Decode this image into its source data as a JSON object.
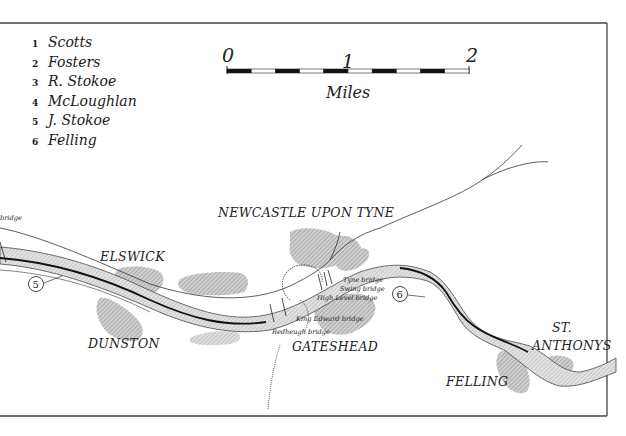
{
  "legend": {
    "items": [
      {
        "number": "1",
        "name": "Scotts"
      },
      {
        "number": "2",
        "name": "Fosters"
      },
      {
        "number": "3",
        "name": "R. Stokoe"
      },
      {
        "number": "4",
        "name": "McLoughlan"
      },
      {
        "number": "5",
        "name": "J. Stokoe"
      },
      {
        "number": "6",
        "name": "Felling"
      }
    ]
  },
  "scale_bar": {
    "ticks": [
      "0",
      "1",
      "2"
    ],
    "unit": "Miles",
    "segments_per_unit": 5
  },
  "places": {
    "newcastle": "NEWCASTLE UPON TYNE",
    "elswick": "ELSWICK",
    "dunston": "DUNSTON",
    "gateshead": "GATESHEAD",
    "st": "ST.",
    "anthonys": "ANTHONYS",
    "felling": "FELLING"
  },
  "bridges": {
    "tyne": "Tyne bridge",
    "swing": "Swing bridge",
    "high_level": "High Level bridge",
    "king_edward": "King Edward bridge",
    "redheugh": "Redheugh bridge",
    "left_edge": "bridge"
  },
  "markers": {
    "five": "5",
    "six": "6"
  },
  "colors": {
    "ink": "#222222",
    "frame": "#444444",
    "urban_fill": "#b8b8b8",
    "river_fill": "#c8c8c8"
  }
}
